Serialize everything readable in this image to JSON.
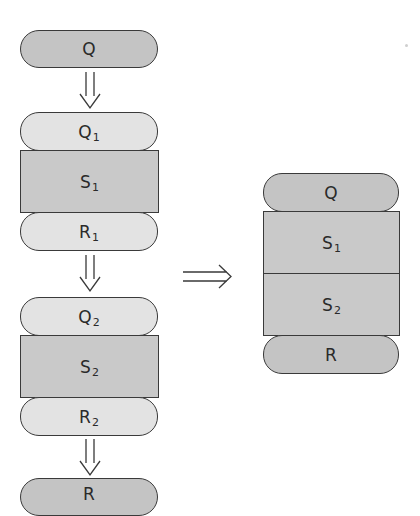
{
  "colors": {
    "outline": "#3a3a3a",
    "dark_fill": "#c4c4c4",
    "light_fill": "#e3e3e3",
    "block_fill": "#c9c9c9",
    "background": "#ffffff"
  },
  "left_chain": {
    "top": {
      "base": "Q",
      "sub": ""
    },
    "first": {
      "pre": {
        "base": "Q",
        "sub": "1"
      },
      "stmt": {
        "base": "S",
        "sub": "1"
      },
      "post": {
        "base": "R",
        "sub": "1"
      }
    },
    "second": {
      "pre": {
        "base": "Q",
        "sub": "2"
      },
      "stmt": {
        "base": "S",
        "sub": "2"
      },
      "post": {
        "base": "R",
        "sub": "2"
      }
    },
    "bottom": {
      "base": "R",
      "sub": ""
    }
  },
  "implies_arrow": "⇒",
  "right_composite": {
    "pre": {
      "base": "Q",
      "sub": ""
    },
    "stmt1": {
      "base": "S",
      "sub": "1"
    },
    "stmt2": {
      "base": "S",
      "sub": "2"
    },
    "post": {
      "base": "R",
      "sub": ""
    }
  }
}
